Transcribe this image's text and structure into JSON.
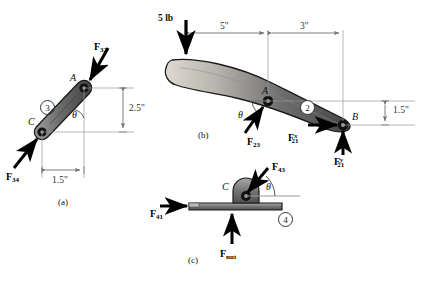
{
  "figure": {
    "type": "free-body-diagram",
    "title": "",
    "parts": [
      {
        "id": "a",
        "caption": "(a)",
        "body_label": "3",
        "points": [
          "A",
          "C"
        ],
        "angle_label": "θ",
        "dimensions": [
          {
            "label": "2.5\"",
            "value": 2.5,
            "unit": "in",
            "orientation": "vertical"
          },
          {
            "label": "1.5\"",
            "value": 1.5,
            "unit": "in",
            "orientation": "horizontal"
          }
        ],
        "forces": [
          {
            "symbol": "F",
            "sub": "32",
            "sup": "",
            "label": "F32",
            "direction": "into-A-down-left"
          },
          {
            "symbol": "F",
            "sub": "34",
            "sup": "",
            "label": "F34",
            "direction": "into-C-up-right"
          }
        ]
      },
      {
        "id": "b",
        "caption": "(b)",
        "body_label": "2",
        "points": [
          "A",
          "B"
        ],
        "angle_label": "θ",
        "applied_load": {
          "label": "5 lb",
          "value": 5,
          "unit": "lb",
          "direction": "down"
        },
        "dimensions": [
          {
            "label": "5\"",
            "value": 5,
            "unit": "in",
            "orientation": "horizontal"
          },
          {
            "label": "3\"",
            "value": 3,
            "unit": "in",
            "orientation": "horizontal"
          },
          {
            "label": "1.5\"",
            "value": 1.5,
            "unit": "in",
            "orientation": "vertical"
          }
        ],
        "forces": [
          {
            "symbol": "F",
            "sub": "23",
            "sup": "",
            "label": "F23",
            "direction": "into-A-up-right"
          },
          {
            "symbol": "F",
            "sub": "21",
            "sup": "x",
            "label": "F21x",
            "direction": "right"
          },
          {
            "symbol": "F",
            "sub": "21",
            "sup": "y",
            "label": "F21y",
            "direction": "up"
          }
        ]
      },
      {
        "id": "c",
        "caption": "(c)",
        "body_label": "4",
        "points": [
          "C"
        ],
        "angle_label": "θ",
        "dimensions": [],
        "forces": [
          {
            "symbol": "F",
            "sub": "43",
            "sup": "",
            "label": "F43",
            "direction": "into-C-down-left"
          },
          {
            "symbol": "F",
            "sub": "41",
            "sup": "",
            "label": "F41",
            "direction": "right"
          },
          {
            "symbol": "F",
            "sub": "nut",
            "sup": "",
            "label": "Fnut",
            "direction": "up"
          }
        ]
      }
    ]
  },
  "labels": {
    "load_5lb": "5 lb",
    "dim_5in": "5\"",
    "dim_3in": "3\"",
    "dim_15in_b": "1.5\"",
    "dim_25in_a": "2.5\"",
    "dim_15in_a": "1.5\"",
    "point_A_a": "A",
    "point_C_a": "C",
    "point_A_b": "A",
    "point_B_b": "B",
    "point_C_c": "C",
    "theta_a": "θ",
    "theta_b": "θ",
    "theta_c": "θ",
    "link2": "2",
    "link3": "3",
    "link4": "4",
    "caption_a": "(a)",
    "caption_b": "(b)",
    "caption_c": "(c)",
    "f_symbol": "F",
    "sub_32": "32",
    "sub_34": "34",
    "sub_23": "23",
    "sub_21": "21",
    "sup_x": "x",
    "sup_y": "y",
    "sub_43": "43",
    "sub_41": "41",
    "sub_nut": "nut"
  },
  "colors": {
    "body_dark": "#5a5a5a",
    "body_mid": "#8c8c8c",
    "body_light": "#d4d4d0",
    "outline": "#1a1a1a",
    "dimension_line": "#808080",
    "arrow": "#000000",
    "background": "#ffffff"
  }
}
